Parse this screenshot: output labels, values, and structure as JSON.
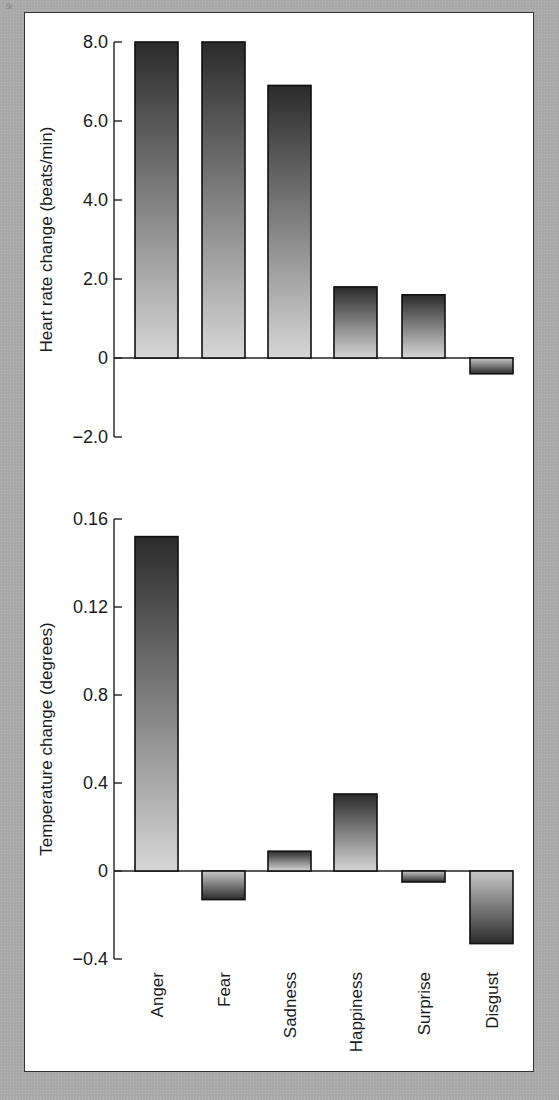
{
  "figure": {
    "categories": [
      "Anger",
      "Fear",
      "Sadness",
      "Happiness",
      "Surprise",
      "Disgust"
    ],
    "top_panel": {
      "ylabel": "Heart rate change (beats/min)",
      "yticks": [
        "8.0",
        "6.0",
        "4.0",
        "2.0",
        "0",
        "−2.0"
      ]
    },
    "bottom_panel": {
      "ylabel": "Temperature change (degrees)",
      "yticks": [
        "0.16",
        "0.12",
        "0.8",
        "0.4",
        "0",
        "−0.4"
      ]
    }
  },
  "chart_data": [
    {
      "type": "bar",
      "title": "",
      "categories": [
        "Anger",
        "Fear",
        "Sadness",
        "Happiness",
        "Surprise",
        "Disgust"
      ],
      "values": [
        8.0,
        8.0,
        6.9,
        1.8,
        1.6,
        -0.4
      ],
      "xlabel": "",
      "ylabel": "Heart rate change (beats/min)",
      "ylim": [
        -2.0,
        8.0
      ],
      "yticks": [
        8.0,
        6.0,
        4.0,
        2.0,
        0,
        -2.0
      ],
      "grid": false,
      "legend": null
    },
    {
      "type": "bar",
      "title": "",
      "categories": [
        "Anger",
        "Fear",
        "Sadness",
        "Happiness",
        "Surprise",
        "Disgust"
      ],
      "values": [
        0.152,
        -0.013,
        0.009,
        0.035,
        -0.005,
        -0.033
      ],
      "xlabel": "",
      "ylabel": "Temperature change (degrees)",
      "ylim": [
        -0.04,
        0.16
      ],
      "yticks_as_printed": [
        "0.16",
        "0.12",
        "0.8",
        "0.4",
        "0",
        "-0.4"
      ],
      "grid": false,
      "legend": null
    }
  ]
}
